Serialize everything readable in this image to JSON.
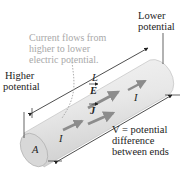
{
  "diagram": {
    "type": "current-carrying conductor",
    "annotations": {
      "current_flow_note": [
        "Current flows from",
        "higher to lower",
        "electric potential."
      ],
      "lower_potential": [
        "Lower",
        "potential"
      ],
      "higher_potential": [
        "Higher",
        "potential"
      ],
      "length_label": "L",
      "area_label": "A",
      "field_label": "E",
      "current_density_label": "J",
      "current_label": "I",
      "voltage_label": [
        "V = potential",
        "difference",
        "between ends"
      ]
    },
    "colors": {
      "cylinder_body": "#e6e6e6",
      "cylinder_end": "#d8d8d8",
      "arrow_gray": "#8c8c8c",
      "note_text": "#a9a9a9",
      "line": "#222222"
    }
  }
}
